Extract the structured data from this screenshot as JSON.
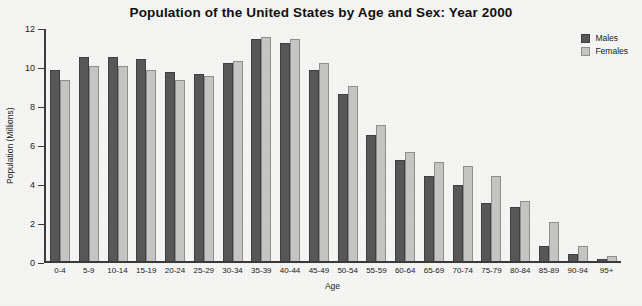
{
  "chart_data": {
    "type": "bar",
    "title": "Population of the United States by Age and Sex: Year 2000",
    "xlabel": "Age",
    "ylabel": "Population (Millions)",
    "ylim": [
      0,
      12
    ],
    "yticks": [
      0,
      2,
      4,
      6,
      8,
      10,
      12
    ],
    "grid": false,
    "legend_position": "top-right",
    "categories": [
      "0-4",
      "5-9",
      "10-14",
      "15-19",
      "20-24",
      "25-29",
      "30-34",
      "35-39",
      "40-44",
      "45-49",
      "50-54",
      "55-59",
      "60-64",
      "65-69",
      "70-74",
      "75-79",
      "80-84",
      "85-89",
      "90-94",
      "95+"
    ],
    "series": [
      {
        "name": "Males",
        "color": "#575757",
        "values": [
          9.8,
          10.5,
          10.5,
          10.4,
          9.7,
          9.6,
          10.2,
          11.4,
          11.2,
          9.8,
          8.6,
          6.5,
          5.2,
          4.4,
          3.9,
          3.0,
          2.8,
          0.8,
          0.4,
          0.1
        ]
      },
      {
        "name": "Females",
        "color": "#c4c4c2",
        "values": [
          9.3,
          10.0,
          10.0,
          9.8,
          9.3,
          9.5,
          10.3,
          11.5,
          11.4,
          10.2,
          9.0,
          7.0,
          5.6,
          5.1,
          4.9,
          4.4,
          3.1,
          2.0,
          0.8,
          0.3
        ]
      }
    ]
  },
  "legend": {
    "items": [
      {
        "label": "Males"
      },
      {
        "label": "Females"
      }
    ]
  }
}
